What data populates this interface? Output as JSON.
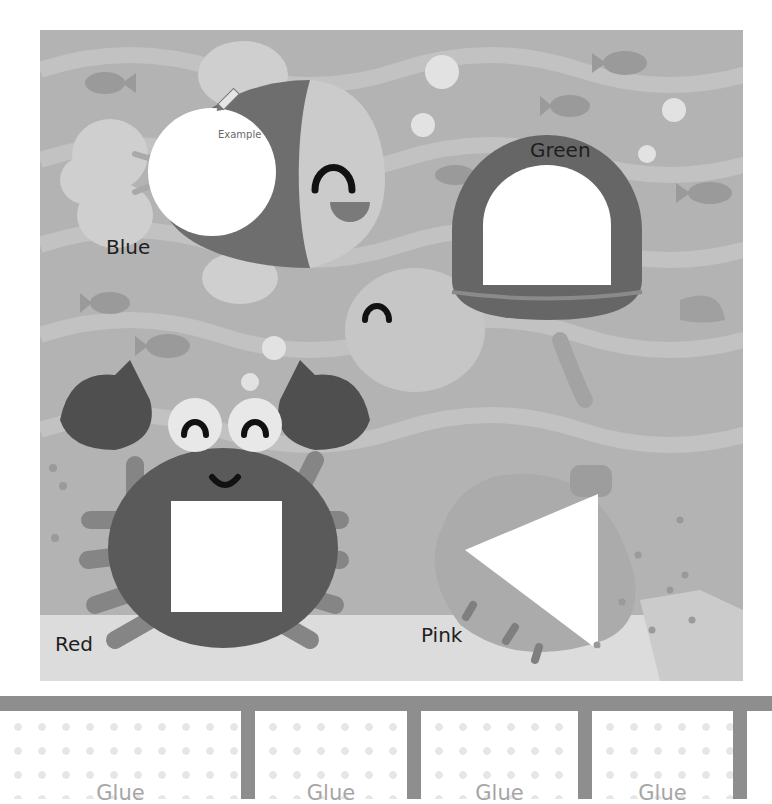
{
  "worksheet": {
    "scene": {
      "shapes": [
        {
          "animal": "fish",
          "shape": "circle",
          "color_label": "Blue",
          "example_label": "Example",
          "is_example": true
        },
        {
          "animal": "turtle",
          "shape": "semicircle",
          "color_label": "Green"
        },
        {
          "animal": "crab",
          "shape": "square",
          "color_label": "Red"
        },
        {
          "animal": "shell",
          "shape": "triangle",
          "color_label": "Pink"
        }
      ],
      "icons": [
        "crayon-icon"
      ]
    },
    "glue_boxes": [
      {
        "label": "Glue"
      },
      {
        "label": "Glue"
      },
      {
        "label": "Glue"
      },
      {
        "label": "Glue"
      }
    ]
  },
  "colors": {
    "water": "#b3b3b3",
    "wave": "#c4c4c4",
    "dark_body": "#5a5a5a",
    "medium_body": "#8a8a8a",
    "light_body": "#c8c8c8",
    "cutout": "#ffffff",
    "band": "#8e8e8e"
  }
}
